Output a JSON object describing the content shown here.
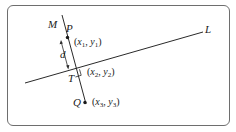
{
  "diagram": {
    "lines": {
      "L": {
        "label": "L"
      },
      "M": {
        "label": "M"
      }
    },
    "points": {
      "P": {
        "label": "P",
        "coord_x": "x",
        "coord_x_sub": "1",
        "coord_y": "y",
        "coord_y_sub": "1"
      },
      "T": {
        "label": "T",
        "coord_x": "x",
        "coord_x_sub": "2",
        "coord_y": "y",
        "coord_y_sub": "2"
      },
      "Q": {
        "label": "Q",
        "coord_x": "x",
        "coord_x_sub": "3",
        "coord_y": "y",
        "coord_y_sub": "3"
      }
    },
    "distance_label": "d",
    "colors": {
      "line": "#2a2a2a",
      "frame": "#6e6e6e"
    }
  }
}
